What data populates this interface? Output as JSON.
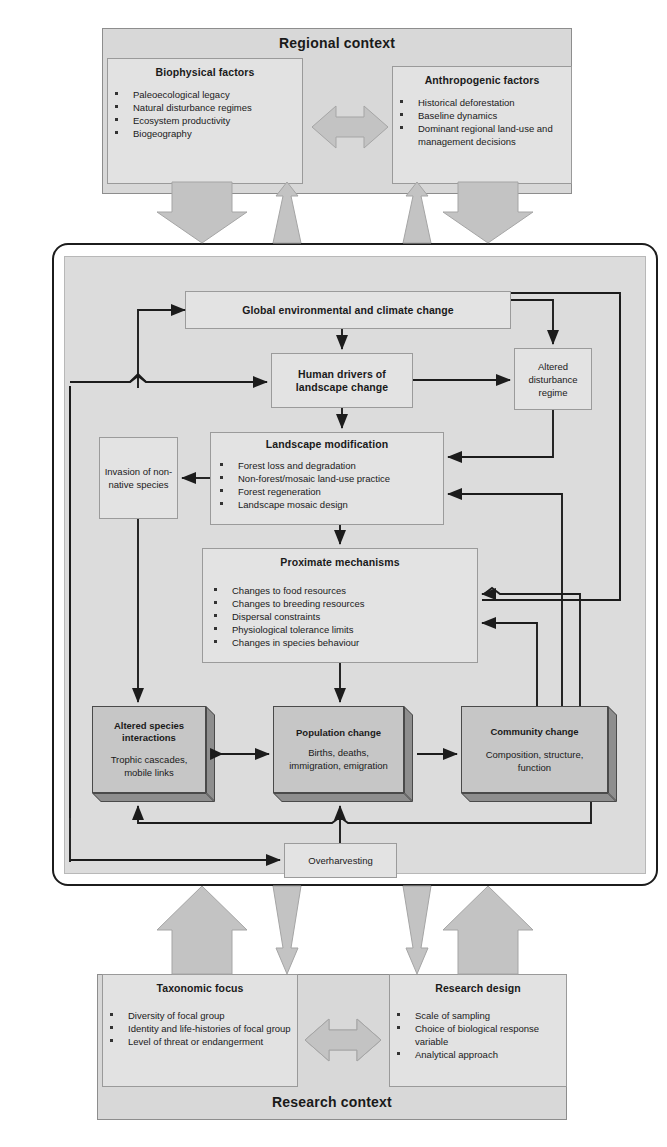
{
  "regional_context": {
    "title": "Regional context",
    "left_panel": {
      "heading": "Biophysical factors",
      "items": [
        "Paleoecological legacy",
        "Natural disturbance regimes",
        "Ecosystem productivity",
        "Biogeography"
      ]
    },
    "right_panel": {
      "heading": "Anthropogenic factors",
      "items": [
        "Historical deforestation",
        "Baseline dynamics",
        "Dominant regional land-use and management decisions"
      ]
    },
    "connector_icon": "double-headed-arrow-icon"
  },
  "core": {
    "global_change": "Global environmental and climate change",
    "human_drivers": "Human drivers of landscape change",
    "altered_disturbance": "Altered disturbance regime",
    "invasion": "Invasion of non-native species",
    "landscape_modification": {
      "heading": "Landscape modification",
      "items": [
        "Forest loss and degradation",
        "Non-forest/mosaic land-use practice",
        "Forest regeneration",
        "Landscape mosaic design"
      ]
    },
    "proximate_mechanisms": {
      "heading": "Proximate mechanisms",
      "items": [
        "Changes to food resources",
        "Changes to breeding resources",
        "Dispersal constraints",
        "Physiological tolerance limits",
        "Changes in species behaviour"
      ]
    },
    "altered_species": {
      "heading": "Altered species interactions",
      "body": "Trophic cascades, mobile links"
    },
    "population_change": {
      "heading": "Population change",
      "body": "Births, deaths, immigration, emigration"
    },
    "community_change": {
      "heading": "Community change",
      "body": "Composition, structure, function"
    },
    "overharvesting": "Overharvesting"
  },
  "research_context": {
    "title": "Research context",
    "left_panel": {
      "heading": "Taxonomic focus",
      "items": [
        "Diversity of focal group",
        "Identity and life-histories of focal group",
        "Level of threat or endangerment"
      ]
    },
    "right_panel": {
      "heading": "Research design",
      "items": [
        "Scale of sampling",
        "Choice of biological response variable",
        "Analytical approach"
      ]
    },
    "connector_icon": "double-headed-arrow-icon"
  },
  "colors": {
    "context_panel_fill": "#d8d8d8",
    "sub_panel_fill": "#e2e2e2",
    "core_panel_fill": "#dcdcdc",
    "box_fill": "#e3e3e3",
    "shaded_box_fill": "#c6c6c6",
    "shaded_box_shadow": "#8e8e8e",
    "block_arrow_fill": "#c3c3c3",
    "line_color": "#1c1c1c"
  }
}
